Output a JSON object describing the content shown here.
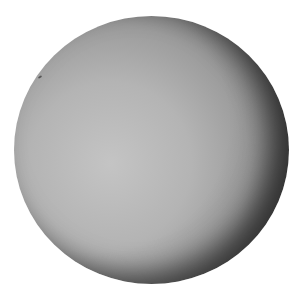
{
  "image": {
    "subject": "grayscale sphere (planetary body)",
    "background_color": "#ffffff",
    "sphere_color_light": "#c4c4c4",
    "sphere_color_dark": "#000000"
  }
}
